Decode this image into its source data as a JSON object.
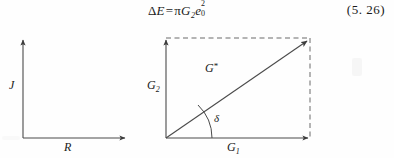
{
  "page": {
    "width": 394,
    "height": 158,
    "background": "#fefefe",
    "ink": "#1a1a1a"
  },
  "equation": {
    "lhs_delta": "Δ",
    "lhs_var": "E",
    "equals": "=",
    "pi": "π",
    "g_var": "G",
    "g_sub": "2",
    "e_var": "e",
    "e_sub": "0",
    "e_sup": "2",
    "full_text": "ΔE=πG₂e₀²",
    "number": "(5. 26)"
  },
  "figures": [
    {
      "id": "left-axes",
      "type": "empty-axes",
      "y_axis_label": "J",
      "x_axis_label": "R",
      "origin": [
        23,
        114
      ],
      "y_tip": [
        23,
        14
      ],
      "x_tip": [
        127,
        114
      ]
    },
    {
      "id": "right-vector-diagram",
      "type": "complex-modulus-vector",
      "y_axis_label": "G",
      "y_axis_sub": "2",
      "x_axis_label": "G",
      "x_axis_sub": "1",
      "resultant_label": "G",
      "resultant_sup": "*",
      "angle_label": "δ",
      "origin": [
        166,
        114
      ],
      "y_tip": [
        166,
        14
      ],
      "x_tip": [
        310,
        114
      ],
      "corner": [
        310,
        14
      ],
      "dashed_edges": [
        "top",
        "right"
      ]
    }
  ],
  "colors": {
    "line": "#4a4a4a",
    "dashed": "#6a6a6a",
    "text": "#1a1a1a"
  }
}
